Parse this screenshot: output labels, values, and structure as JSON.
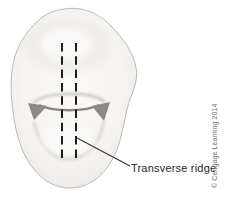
{
  "figure": {
    "type": "dental-anatomy-diagram",
    "label": "Transverse ridge",
    "copyright": "© Cengage Learning 2014",
    "colors": {
      "background": "#ffffff",
      "tooth_fill": "#f6f4f1",
      "tooth_outline": "#bdb9b5",
      "groove": "#8a857e",
      "dashed_marker": "#1c1c1c",
      "leader_line": "#3c3c3c",
      "label_text": "#1f1f1f",
      "copyright_text": "#6e6e6e"
    }
  }
}
